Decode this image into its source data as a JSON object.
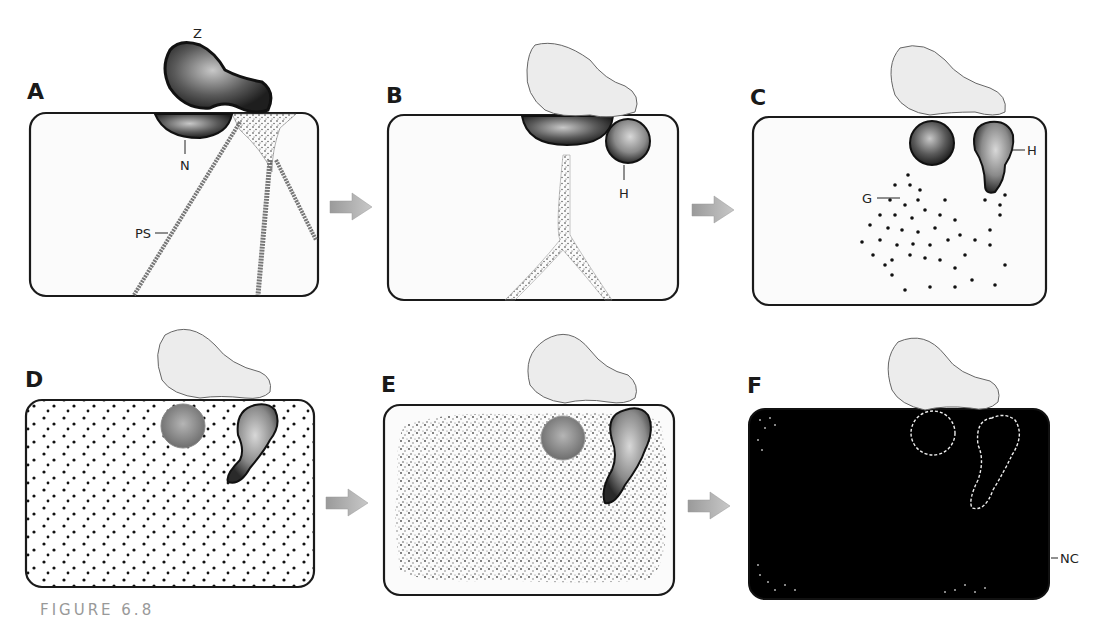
{
  "figure": {
    "caption": "FIGURE 6.8",
    "caption_continuation": "Steps in the development ..."
  },
  "panels": [
    {
      "letter": "A",
      "labels": [
        "Z",
        "N",
        "PS"
      ]
    },
    {
      "letter": "B",
      "labels": [
        "H"
      ]
    },
    {
      "letter": "C",
      "labels": [
        "G",
        "H"
      ]
    },
    {
      "letter": "D",
      "labels": []
    },
    {
      "letter": "E",
      "labels": []
    },
    {
      "letter": "F",
      "labels": [
        "NC"
      ]
    }
  ],
  "labels": {
    "Z": "Z",
    "N": "N",
    "PS": "PS",
    "H": "H",
    "G": "G",
    "NC": "NC"
  },
  "colors": {
    "outline": "#1a1a1a",
    "cell_fill": "#fbfbfb",
    "arrow": "#a8a8a8",
    "pollen_light": "#eeeeee",
    "nucleus_dark": "#3a3a3a",
    "cell_F_fill": "#000000"
  }
}
